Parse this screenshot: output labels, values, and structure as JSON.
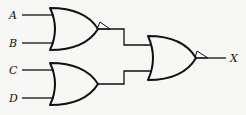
{
  "diagram": {
    "type": "logic-circuit",
    "inputs": [
      {
        "label": "A",
        "y": 15
      },
      {
        "label": "B",
        "y": 43
      },
      {
        "label": "C",
        "y": 70
      },
      {
        "label": "D",
        "y": 98
      }
    ],
    "output": {
      "label": "X"
    },
    "gates": [
      {
        "id": "gate-1",
        "type": "OR",
        "inputs": [
          "A",
          "B"
        ],
        "has_output_triangle": true
      },
      {
        "id": "gate-2",
        "type": "OR",
        "inputs": [
          "C",
          "D"
        ],
        "has_output_triangle": false
      },
      {
        "id": "gate-3",
        "type": "OR",
        "inputs": [
          "gate-1",
          "gate-2"
        ],
        "output": "X",
        "has_output_triangle": true
      }
    ],
    "colors": {
      "line": "#111111",
      "background": "#f7f7f5"
    }
  }
}
